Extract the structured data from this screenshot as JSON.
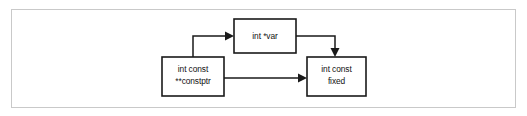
{
  "figure": {
    "background_color": "#ffffff",
    "frame_color": "#c9c9c9",
    "stroke_color": "#1a1a1a"
  },
  "nodes": [
    {
      "id": "var-node",
      "name": "node-int-star-var",
      "lines": [
        "int *var"
      ],
      "x": 234,
      "y": 19,
      "width": 62,
      "height": 34
    },
    {
      "id": "constptr-node",
      "name": "node-int-const-constptr",
      "lines": [
        "int const",
        "**constptr"
      ],
      "x": 162,
      "y": 57,
      "width": 62,
      "height": 39
    },
    {
      "id": "fixed-node",
      "name": "node-int-const-fixed",
      "lines": [
        "int const",
        "fixed"
      ],
      "x": 307,
      "y": 57,
      "width": 59,
      "height": 39
    }
  ],
  "edges": [
    {
      "id": "edge-constptr-to-var",
      "name": "arrow-constptr-to-var",
      "from": "constptr-node",
      "to": "var-node",
      "path": "M 193 57 L 193 36 L 227 36",
      "arrow_points": "234,36 225,31.5 225,40.5"
    },
    {
      "id": "edge-var-to-fixed",
      "name": "arrow-var-to-fixed",
      "from": "var-node",
      "to": "fixed-node",
      "path": "M 296 36 L 335 36 L 335 50",
      "arrow_points": "335,57 330.5,48 339.5,48"
    },
    {
      "id": "edge-constptr-to-fixed",
      "name": "arrow-constptr-to-fixed",
      "from": "constptr-node",
      "to": "fixed-node",
      "path": "M 224 78 L 300 78",
      "arrow_points": "307,78 298,73.5 298,82.5"
    }
  ]
}
